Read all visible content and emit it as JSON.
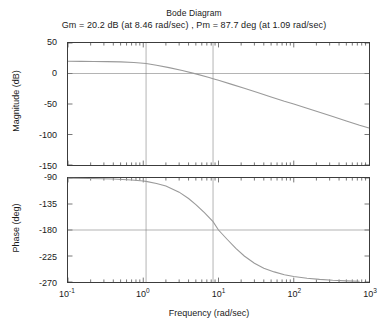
{
  "figure": {
    "title": "Bode Diagram",
    "margins_line": "Gm = 20.2 dB (at 8.46 rad/sec) ,  Pm = 87.7 deg (at 1.09 rad/sec)",
    "xlabel": "Frequency  (rad/sec)"
  },
  "chart_data": {
    "type": "line",
    "title": "Bode Diagram",
    "subtitle": "Gm = 20.2 dB (at 8.46 rad/sec) ,  Pm = 87.7 deg (at 1.09 rad/sec)",
    "xlabel": "Frequency  (rad/sec)",
    "xscale": "log",
    "xlim": [
      0.1,
      1000
    ],
    "xticks": [
      0.1,
      1,
      10,
      100,
      1000
    ],
    "xticklabels": [
      "10-1",
      "100",
      "101",
      "102",
      "103"
    ],
    "grid": true,
    "legend": "none",
    "gain_margin_db": 20.2,
    "gain_margin_freq": 8.46,
    "phase_margin_deg": 87.7,
    "phase_margin_freq": 1.09,
    "panels": [
      {
        "name": "magnitude",
        "ylabel": "Magnitude (dB)",
        "ylim": [
          -150,
          50
        ],
        "yticks": [
          50,
          0,
          -50,
          -100,
          -150
        ],
        "yticklabels": [
          "50",
          "0",
          "-50",
          "-100",
          "-150"
        ],
        "gridlines_h": [
          0
        ],
        "gridlines_v": [
          1.09,
          8.46
        ],
        "series": [
          {
            "name": "magnitude",
            "color": "#9a9a9a",
            "x": [
              0.1,
              0.15,
              0.22,
              0.33,
              0.5,
              0.75,
              1.0,
              1.09,
              1.5,
              2.2,
              3.3,
              5.0,
              7.5,
              8.46,
              10,
              15,
              22,
              33,
              50,
              75,
              100,
              150,
              220,
              330,
              500,
              750,
              1000
            ],
            "values": [
              20.0,
              19.9,
              19.8,
              19.5,
              19.0,
              18.0,
              16.8,
              16.3,
              13.5,
              9.6,
              5.0,
              -0.6,
              -6.6,
              -8.5,
              -11.2,
              -17.8,
              -24.2,
              -31.1,
              -38.5,
              -45.5,
              -50.0,
              -56.9,
              -63.6,
              -70.6,
              -78.0,
              -85.0,
              -89.5
            ],
            "unit": "dB"
          }
        ]
      },
      {
        "name": "phase",
        "ylabel": "Phase (deg)",
        "ylim": [
          -270,
          -90
        ],
        "yticks": [
          -90,
          -135,
          -180,
          -225,
          -270
        ],
        "yticklabels": [
          "-90",
          "-135",
          "-180",
          "-225",
          "-270"
        ],
        "gridlines_h": [
          -180
        ],
        "gridlines_v": [
          1.09,
          8.46
        ],
        "series": [
          {
            "name": "phase",
            "color": "#9a9a9a",
            "x": [
              0.1,
              0.2,
              0.4,
              0.7,
              1.0,
              1.09,
              1.5,
              2.0,
              3.0,
              4.0,
              5.0,
              6.5,
              8.46,
              10,
              13,
              17,
              22,
              30,
              40,
              55,
              75,
              100,
              150,
              220,
              330,
              500,
              750,
              1000
            ],
            "values": [
              -90.3,
              -90.8,
              -91.8,
              -93.4,
              -95.2,
              -95.8,
              -99.5,
              -104.0,
              -114.5,
              -125.5,
              -136.0,
              -150.0,
              -165.5,
              -180.0,
              -196.0,
              -212.0,
              -225.0,
              -237.5,
              -246.0,
              -252.5,
              -257.5,
              -260.5,
              -263.5,
              -265.5,
              -267.0,
              -268.0,
              -268.7
            ],
            "unit": "deg"
          }
        ]
      }
    ]
  },
  "magnitude_axis": {
    "ylabel": "Magnitude (dB)",
    "yticklabels": [
      "50",
      "0",
      "-50",
      "-100",
      "-150"
    ]
  },
  "phase_axis": {
    "ylabel": "Phase (deg)",
    "yticklabels": [
      "-90",
      "-135",
      "-180",
      "-225",
      "-270"
    ]
  },
  "xaxis": {
    "ticks": [
      {
        "mantissa": "10",
        "exp": "-1"
      },
      {
        "mantissa": "10",
        "exp": "0"
      },
      {
        "mantissa": "10",
        "exp": "1"
      },
      {
        "mantissa": "10",
        "exp": "2"
      },
      {
        "mantissa": "10",
        "exp": "3"
      }
    ]
  },
  "colors": {
    "curve": "#9a9a9a",
    "axis": "#3c3c3c",
    "grid": "#808080",
    "text": "#1a1a1a"
  }
}
